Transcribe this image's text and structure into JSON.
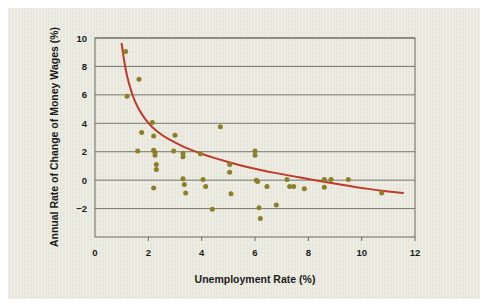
{
  "figure": {
    "page_background": "#ffffff",
    "panel_background": "#e7e6da",
    "panel_border": "#d8d7c9"
  },
  "chart_data": {
    "type": "scatter",
    "title": "",
    "subtitle": "",
    "xlabel": "Unemployment Rate (%)",
    "ylabel": "Annual Rate of Change of Money Wages (%)",
    "xlim": [
      0,
      12
    ],
    "ylim": [
      -4,
      10
    ],
    "xticks": [
      0,
      2,
      4,
      6,
      8,
      10,
      12
    ],
    "yticks": [
      -2,
      0,
      2,
      4,
      6,
      8,
      10
    ],
    "xtick_labels": [
      "0",
      "2",
      "4",
      "6",
      "8",
      "10",
      "12"
    ],
    "ytick_labels": [
      "-2",
      "0",
      "2",
      "4",
      "6",
      "8",
      "10"
    ],
    "grid": "horizontal",
    "grid_color": "#6a6a62",
    "legend": "none",
    "marker_color": "#8b8029",
    "marker_size": 5,
    "points": [
      [
        1.15,
        9.05
      ],
      [
        1.2,
        5.9
      ],
      [
        1.65,
        7.1
      ],
      [
        1.6,
        2.05
      ],
      [
        1.75,
        3.35
      ],
      [
        2.15,
        4.05
      ],
      [
        2.2,
        3.1
      ],
      [
        2.2,
        2.1
      ],
      [
        2.25,
        1.95
      ],
      [
        2.25,
        1.75
      ],
      [
        2.3,
        1.1
      ],
      [
        2.3,
        0.75
      ],
      [
        2.2,
        -0.55
      ],
      [
        2.95,
        2.05
      ],
      [
        3.0,
        3.15
      ],
      [
        3.3,
        1.9
      ],
      [
        3.3,
        1.65
      ],
      [
        3.3,
        0.1
      ],
      [
        3.35,
        -0.3
      ],
      [
        3.4,
        -0.9
      ],
      [
        3.95,
        1.85
      ],
      [
        4.05,
        0.05
      ],
      [
        4.15,
        -0.45
      ],
      [
        4.4,
        -2.05
      ],
      [
        4.7,
        3.75
      ],
      [
        5.05,
        1.1
      ],
      [
        5.05,
        0.55
      ],
      [
        5.1,
        -0.95
      ],
      [
        6.0,
        2.05
      ],
      [
        6.0,
        1.75
      ],
      [
        6.05,
        0.0
      ],
      [
        6.1,
        -0.1
      ],
      [
        6.15,
        -1.95
      ],
      [
        6.2,
        -2.7
      ],
      [
        6.45,
        -0.45
      ],
      [
        6.8,
        -1.75
      ],
      [
        7.2,
        0.05
      ],
      [
        7.3,
        -0.45
      ],
      [
        7.45,
        -0.45
      ],
      [
        7.85,
        -0.6
      ],
      [
        8.6,
        0.05
      ],
      [
        8.6,
        -0.5
      ],
      [
        8.85,
        0.05
      ],
      [
        9.5,
        0.05
      ],
      [
        10.75,
        -0.9
      ]
    ],
    "fit_curve": {
      "name": "phillips-curve-fit",
      "color": "#c0392b",
      "width": 2,
      "x_start": 1.0,
      "x_end": 11.55,
      "points": [
        [
          1.0,
          9.6
        ],
        [
          1.1,
          8.3
        ],
        [
          1.2,
          7.3
        ],
        [
          1.35,
          6.3
        ],
        [
          1.5,
          5.5
        ],
        [
          1.7,
          4.8
        ],
        [
          1.9,
          4.25
        ],
        [
          2.1,
          3.8
        ],
        [
          2.35,
          3.4
        ],
        [
          2.6,
          3.05
        ],
        [
          2.9,
          2.75
        ],
        [
          3.2,
          2.45
        ],
        [
          3.5,
          2.2
        ],
        [
          3.9,
          1.92
        ],
        [
          4.3,
          1.66
        ],
        [
          4.7,
          1.44
        ],
        [
          5.1,
          1.22
        ],
        [
          5.5,
          1.02
        ],
        [
          6.0,
          0.8
        ],
        [
          6.5,
          0.6
        ],
        [
          7.0,
          0.42
        ],
        [
          7.5,
          0.25
        ],
        [
          8.0,
          0.08
        ],
        [
          8.5,
          -0.08
        ],
        [
          9.0,
          -0.24
        ],
        [
          9.5,
          -0.4
        ],
        [
          10.0,
          -0.55
        ],
        [
          10.5,
          -0.68
        ],
        [
          11.0,
          -0.8
        ],
        [
          11.55,
          -0.9
        ]
      ]
    }
  }
}
